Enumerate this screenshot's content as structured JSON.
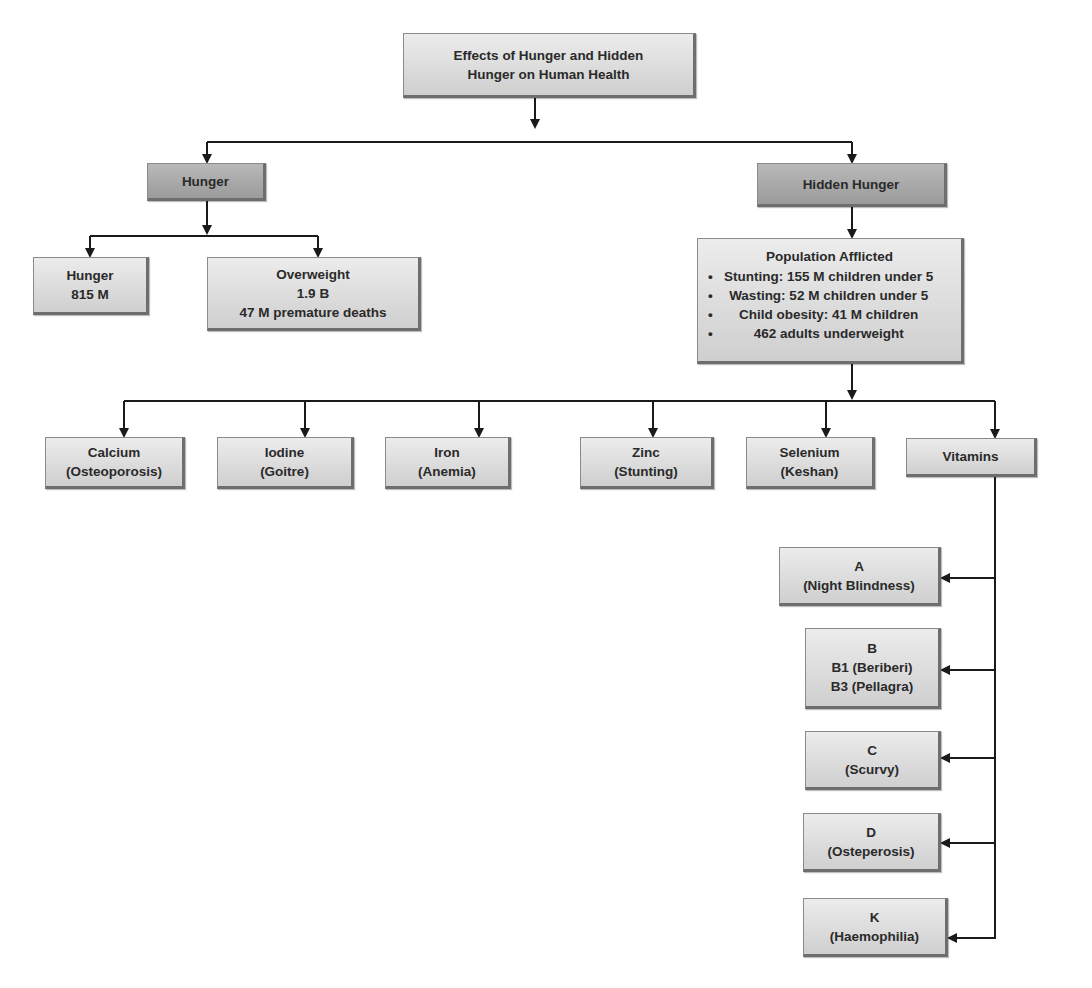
{
  "diagram": {
    "title": {
      "line1": "Effects of Hunger and Hidden",
      "line2": "Hunger on Human Health"
    },
    "branches": {
      "hunger": {
        "label": "Hunger",
        "children": {
          "hunger_count": {
            "line1": "Hunger",
            "line2": "815 M"
          },
          "overweight": {
            "line1": "Overweight",
            "line2": "1.9 B",
            "line3": "47 M premature deaths"
          }
        }
      },
      "hidden_hunger": {
        "label": "Hidden Hunger",
        "population": {
          "heading": "Population Afflicted",
          "items": [
            "Stunting: 155 M children under 5",
            "Wasting: 52 M children under 5",
            "Child obesity: 41 M children",
            "462 adults underweight"
          ]
        },
        "deficiencies": [
          {
            "nutrient": "Calcium",
            "condition": "(Osteoporosis)"
          },
          {
            "nutrient": "Iodine",
            "condition": "(Goitre)"
          },
          {
            "nutrient": "Iron",
            "condition": "(Anemia)"
          },
          {
            "nutrient": "Zinc",
            "condition": "(Stunting)"
          },
          {
            "nutrient": "Selenium",
            "condition": "(Keshan)"
          },
          {
            "nutrient": "Vitamins"
          }
        ],
        "vitamins": [
          {
            "name": "A",
            "line2": "(Night Blindness)"
          },
          {
            "name": "B",
            "line2": "B1 (Beriberi)",
            "line3": "B3 (Pellagra)"
          },
          {
            "name": "C",
            "line2": "(Scurvy)"
          },
          {
            "name": "D",
            "line2": "(Osteperosis)"
          },
          {
            "name": "K",
            "line2": "(Haemophilia)"
          }
        ]
      }
    },
    "colors": {
      "box_light": "#dcdcdc",
      "box_dark": "#a8a8a8",
      "connector": "#1a1a1a"
    }
  }
}
